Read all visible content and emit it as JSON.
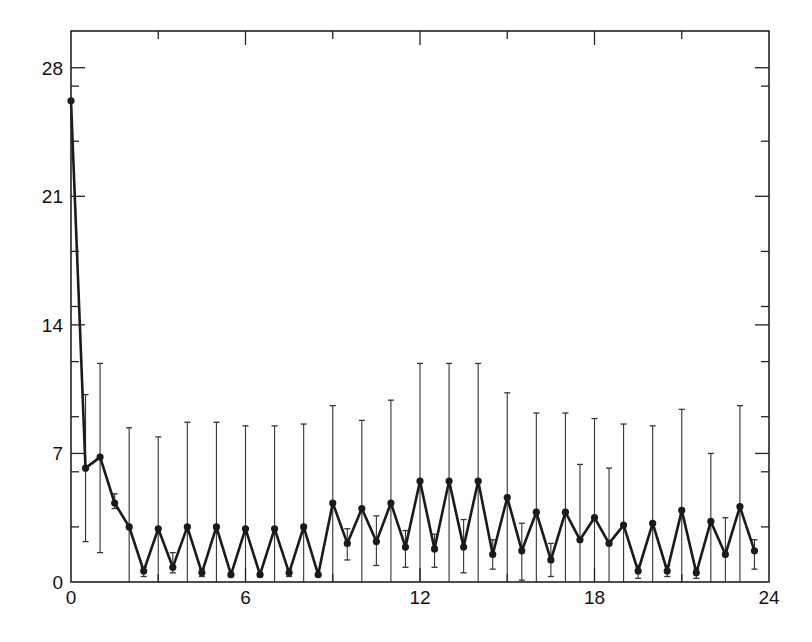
{
  "chart_data": {
    "type": "line",
    "title": "",
    "xlabel": "",
    "ylabel": "",
    "xlim": [
      0,
      24
    ],
    "ylim": [
      0,
      30
    ],
    "grid": false,
    "legend": null,
    "x_ticks_major": [
      0,
      6,
      12,
      18,
      24
    ],
    "x_ticks_minor": [
      3,
      9,
      15,
      21
    ],
    "y_ticks_major": [
      0,
      7,
      14,
      21,
      28
    ],
    "y_ticks_minor": [
      3,
      6,
      9,
      12,
      15,
      18,
      24,
      27
    ],
    "x_tick_labels": [
      "0",
      "6",
      "12",
      "18",
      "24"
    ],
    "y_tick_labels": [
      "0",
      "7",
      "14",
      "21",
      "28"
    ],
    "series": [
      {
        "name": "series-1",
        "marker": "filled-circle",
        "error_bars": true,
        "points": [
          {
            "x": 0.0,
            "y": 26.2,
            "lo": 26.2,
            "hi": 26.2
          },
          {
            "x": 0.5,
            "y": 6.2,
            "lo": 2.2,
            "hi": 10.2
          },
          {
            "x": 1.0,
            "y": 6.8,
            "lo": 1.6,
            "hi": 11.9
          },
          {
            "x": 1.5,
            "y": 4.3,
            "lo": 4.0,
            "hi": 4.8
          },
          {
            "x": 2.0,
            "y": 3.0,
            "lo": 0.0,
            "hi": 8.4
          },
          {
            "x": 2.5,
            "y": 0.6,
            "lo": 0.3,
            "hi": 0.8
          },
          {
            "x": 3.0,
            "y": 2.9,
            "lo": 0.0,
            "hi": 7.9
          },
          {
            "x": 3.5,
            "y": 0.8,
            "lo": 0.5,
            "hi": 1.6
          },
          {
            "x": 4.0,
            "y": 3.0,
            "lo": 0.0,
            "hi": 8.7
          },
          {
            "x": 4.5,
            "y": 0.5,
            "lo": 0.3,
            "hi": 0.7
          },
          {
            "x": 5.0,
            "y": 3.0,
            "lo": 0.0,
            "hi": 8.7
          },
          {
            "x": 5.5,
            "y": 0.4,
            "lo": 0.3,
            "hi": 0.5
          },
          {
            "x": 6.0,
            "y": 2.9,
            "lo": 0.0,
            "hi": 8.5
          },
          {
            "x": 6.5,
            "y": 0.4,
            "lo": 0.3,
            "hi": 0.5
          },
          {
            "x": 7.0,
            "y": 2.9,
            "lo": 0.0,
            "hi": 8.5
          },
          {
            "x": 7.5,
            "y": 0.5,
            "lo": 0.3,
            "hi": 0.7
          },
          {
            "x": 8.0,
            "y": 3.0,
            "lo": 0.0,
            "hi": 8.6
          },
          {
            "x": 8.5,
            "y": 0.4,
            "lo": 0.4,
            "hi": 0.4
          },
          {
            "x": 9.0,
            "y": 4.3,
            "lo": 0.0,
            "hi": 9.6
          },
          {
            "x": 9.5,
            "y": 2.1,
            "lo": 1.2,
            "hi": 2.9
          },
          {
            "x": 10.0,
            "y": 4.0,
            "lo": 0.0,
            "hi": 8.8
          },
          {
            "x": 10.5,
            "y": 2.2,
            "lo": 0.9,
            "hi": 3.6
          },
          {
            "x": 11.0,
            "y": 4.3,
            "lo": 0.0,
            "hi": 9.9
          },
          {
            "x": 11.5,
            "y": 1.9,
            "lo": 0.8,
            "hi": 2.8
          },
          {
            "x": 12.0,
            "y": 5.5,
            "lo": 0.0,
            "hi": 11.9
          },
          {
            "x": 12.5,
            "y": 1.8,
            "lo": 0.8,
            "hi": 2.6
          },
          {
            "x": 13.0,
            "y": 5.5,
            "lo": 0.0,
            "hi": 11.9
          },
          {
            "x": 13.5,
            "y": 1.9,
            "lo": 0.5,
            "hi": 3.4
          },
          {
            "x": 14.0,
            "y": 5.5,
            "lo": 0.0,
            "hi": 11.9
          },
          {
            "x": 14.5,
            "y": 1.5,
            "lo": 0.7,
            "hi": 2.3
          },
          {
            "x": 15.0,
            "y": 4.6,
            "lo": 0.0,
            "hi": 10.3
          },
          {
            "x": 15.5,
            "y": 1.7,
            "lo": 0.1,
            "hi": 3.2
          },
          {
            "x": 16.0,
            "y": 3.8,
            "lo": 0.0,
            "hi": 9.2
          },
          {
            "x": 16.5,
            "y": 1.2,
            "lo": 0.3,
            "hi": 2.1
          },
          {
            "x": 17.0,
            "y": 3.8,
            "lo": 0.0,
            "hi": 9.2
          },
          {
            "x": 17.5,
            "y": 2.3,
            "lo": 0.0,
            "hi": 6.4
          },
          {
            "x": 18.0,
            "y": 3.5,
            "lo": 0.0,
            "hi": 8.9
          },
          {
            "x": 18.5,
            "y": 2.1,
            "lo": 0.0,
            "hi": 6.2
          },
          {
            "x": 19.0,
            "y": 3.1,
            "lo": 0.0,
            "hi": 8.6
          },
          {
            "x": 19.5,
            "y": 0.6,
            "lo": 0.2,
            "hi": 0.9
          },
          {
            "x": 20.0,
            "y": 3.2,
            "lo": 0.0,
            "hi": 8.5
          },
          {
            "x": 20.5,
            "y": 0.6,
            "lo": 0.3,
            "hi": 0.9
          },
          {
            "x": 21.0,
            "y": 3.9,
            "lo": 0.0,
            "hi": 9.4
          },
          {
            "x": 21.5,
            "y": 0.5,
            "lo": 0.2,
            "hi": 0.7
          },
          {
            "x": 22.0,
            "y": 3.3,
            "lo": 0.0,
            "hi": 7.0
          },
          {
            "x": 22.5,
            "y": 1.5,
            "lo": 0.0,
            "hi": 3.5
          },
          {
            "x": 23.0,
            "y": 4.1,
            "lo": 0.0,
            "hi": 9.6
          },
          {
            "x": 23.5,
            "y": 1.7,
            "lo": 0.7,
            "hi": 2.3
          }
        ]
      }
    ]
  },
  "style": {
    "line_color": "#1a1a1a",
    "axis_color": "#222222",
    "errorbar_color": "#333333",
    "background": "#ffffff"
  }
}
